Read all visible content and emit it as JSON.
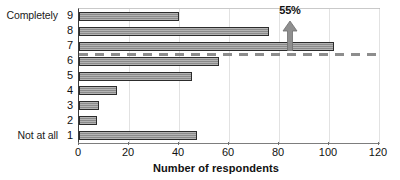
{
  "chart_data": {
    "type": "bar",
    "orientation": "horizontal",
    "title": "",
    "xlabel": "Number of respondents",
    "ylabel": "",
    "categories": [
      "1",
      "2",
      "3",
      "4",
      "5",
      "6",
      "7",
      "8",
      "9"
    ],
    "values": [
      47,
      7,
      8,
      15,
      45,
      56,
      102,
      76,
      40
    ],
    "xlim": [
      0,
      120
    ],
    "xticks": [
      0,
      20,
      40,
      60,
      80,
      100,
      120
    ],
    "xtick_labels": [
      "0",
      "20",
      "40",
      "60",
      "80",
      "100",
      "120"
    ],
    "grid": true,
    "grid_axis": "x",
    "legend": false,
    "scale_anchors": {
      "low": "Not at all",
      "low_category": "1",
      "high": "Completely",
      "high_category": "9"
    },
    "annotations": [
      {
        "label": "55%",
        "type": "arrow-up-with-dashed-threshold",
        "description": "Dashed reference line between categories 6 and 7 with upward arrow and 55% label",
        "threshold_between": [
          "6",
          "7"
        ]
      }
    ],
    "bar_color": "#9a9a9a",
    "bar_edge_color": "#2c2c2c",
    "dashed_line_color": "#8d8d8d"
  },
  "axis": {
    "x_title": "Number of respondents"
  },
  "y_anchor_labels": {
    "top": "Completely",
    "bottom": "Not at all"
  },
  "annotation": {
    "percent_label": "55%"
  }
}
